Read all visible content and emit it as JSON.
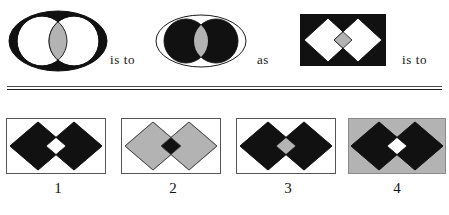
{
  "puzzle": {
    "type": "visual-analogy",
    "connectors": {
      "first": "is to",
      "middle": "as",
      "second": "is to"
    },
    "palette": {
      "black": "#111111",
      "white": "#ffffff",
      "gray": "#b3b3b3",
      "outline": "#1a1a1a",
      "rect_border": "#555555",
      "text": "#151515"
    },
    "prompt_row": {
      "figures": [
        {
          "id": "figure-a",
          "shape": "ellipse-with-two-circles",
          "ellipse_fill": "#111111",
          "ellipse_stroke": "#111111",
          "circle_fill": "#ffffff",
          "circle_stroke": "#111111",
          "overlap_fill": "#b3b3b3",
          "description": "black ellipse containing two white overlapping circles with gray overlap"
        },
        {
          "id": "figure-b",
          "shape": "ellipse-with-two-circles",
          "ellipse_fill": "#ffffff",
          "ellipse_stroke": "#1a1a1a",
          "circle_fill": "#111111",
          "circle_stroke": "#111111",
          "overlap_fill": "#b3b3b3",
          "description": "white ellipse containing two black overlapping circles with gray overlap"
        },
        {
          "id": "figure-c",
          "shape": "rect-with-two-diamonds",
          "rect_fill": "#111111",
          "rect_stroke": "#111111",
          "diamond_fill": "#ffffff",
          "diamond_stroke": "#111111",
          "overlap_fill": "#b3b3b3",
          "description": "black rectangle containing two white overlapping diamonds with gray overlap"
        }
      ]
    },
    "options": [
      {
        "number": "1",
        "shape": "rect-with-two-diamonds",
        "rect_fill": "#ffffff",
        "rect_stroke": "#555555",
        "diamond_fill": "#111111",
        "diamond_stroke": "#111111",
        "overlap_fill": "#ffffff",
        "description": "white rectangle, two black diamonds, white overlap"
      },
      {
        "number": "2",
        "shape": "rect-with-two-diamonds",
        "rect_fill": "#ffffff",
        "rect_stroke": "#555555",
        "diamond_fill": "#b3b3b3",
        "diamond_stroke": "#4a4a4a",
        "overlap_fill": "#111111",
        "description": "white rectangle, two gray diamonds, black overlap"
      },
      {
        "number": "3",
        "shape": "rect-with-two-diamonds",
        "rect_fill": "#ffffff",
        "rect_stroke": "#555555",
        "diamond_fill": "#111111",
        "diamond_stroke": "#111111",
        "overlap_fill": "#b3b3b3",
        "description": "white rectangle, two black diamonds, gray overlap"
      },
      {
        "number": "4",
        "shape": "rect-with-two-diamonds",
        "rect_fill": "#b3b3b3",
        "rect_stroke": "#8a8a8a",
        "diamond_fill": "#111111",
        "diamond_stroke": "#111111",
        "overlap_fill": "#ffffff",
        "description": "gray rectangle, two black diamonds, white overlap"
      }
    ]
  }
}
